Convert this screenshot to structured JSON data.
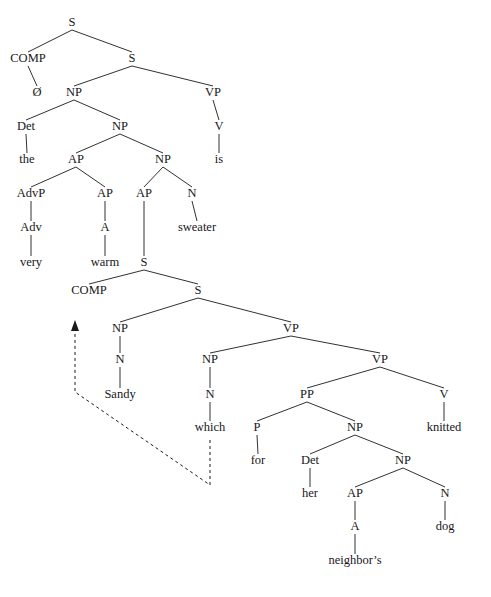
{
  "figure": {
    "background_color": "#ffffff",
    "line_color": "#1a1a1a",
    "text_color": "#17171a",
    "width": 491,
    "height": 597
  },
  "nodes": [
    {
      "id": "s-top",
      "label": "S",
      "x": 72,
      "y": 26,
      "kind": "category"
    },
    {
      "id": "comp-top",
      "label": "COMP",
      "x": 28,
      "y": 62,
      "kind": "category"
    },
    {
      "id": "s-matrix",
      "label": "S",
      "x": 132,
      "y": 62,
      "kind": "category"
    },
    {
      "id": "comp-top-null",
      "label": "Ø",
      "x": 37,
      "y": 96,
      "kind": "leaf"
    },
    {
      "id": "np-subj",
      "label": "NP",
      "x": 74,
      "y": 96,
      "kind": "category"
    },
    {
      "id": "vp-matrix",
      "label": "VP",
      "x": 213,
      "y": 96,
      "kind": "category"
    },
    {
      "id": "det-the",
      "label": "Det",
      "x": 26,
      "y": 130,
      "kind": "category"
    },
    {
      "id": "np-inner",
      "label": "NP",
      "x": 120,
      "y": 130,
      "kind": "category"
    },
    {
      "id": "v-is",
      "label": "V",
      "x": 219,
      "y": 130,
      "kind": "category"
    },
    {
      "id": "the",
      "label": "the",
      "x": 27,
      "y": 163,
      "kind": "leaf"
    },
    {
      "id": "ap-1",
      "label": "AP",
      "x": 76,
      "y": 163,
      "kind": "category"
    },
    {
      "id": "np-2",
      "label": "NP",
      "x": 163,
      "y": 163,
      "kind": "category"
    },
    {
      "id": "is",
      "label": "is",
      "x": 219,
      "y": 163,
      "kind": "leaf"
    },
    {
      "id": "advp",
      "label": "AdvP",
      "x": 31,
      "y": 197,
      "kind": "category"
    },
    {
      "id": "ap-2",
      "label": "AP",
      "x": 105,
      "y": 197,
      "kind": "category"
    },
    {
      "id": "ap-3",
      "label": "AP",
      "x": 144,
      "y": 197,
      "kind": "category"
    },
    {
      "id": "n-sweater",
      "label": "N",
      "x": 192,
      "y": 197,
      "kind": "category"
    },
    {
      "id": "adv",
      "label": "Adv",
      "x": 31,
      "y": 231,
      "kind": "category"
    },
    {
      "id": "a-warm",
      "label": "A",
      "x": 105,
      "y": 231,
      "kind": "category"
    },
    {
      "id": "sweater",
      "label": "sweater",
      "x": 197,
      "y": 231,
      "kind": "leaf"
    },
    {
      "id": "very",
      "label": "very",
      "x": 31,
      "y": 266,
      "kind": "leaf"
    },
    {
      "id": "warm",
      "label": "warm",
      "x": 105,
      "y": 266,
      "kind": "leaf"
    },
    {
      "id": "s-rel",
      "label": "S",
      "x": 144,
      "y": 266,
      "kind": "category"
    },
    {
      "id": "comp-rel",
      "label": "COMP",
      "x": 89,
      "y": 294,
      "kind": "category"
    },
    {
      "id": "s-rel-inner",
      "label": "S",
      "x": 198,
      "y": 294,
      "kind": "category"
    },
    {
      "id": "np-sandy",
      "label": "NP",
      "x": 120,
      "y": 332,
      "kind": "category"
    },
    {
      "id": "vp-rel",
      "label": "VP",
      "x": 291,
      "y": 332,
      "kind": "category"
    },
    {
      "id": "n-sandy",
      "label": "N",
      "x": 120,
      "y": 363,
      "kind": "category"
    },
    {
      "id": "np-which",
      "label": "NP",
      "x": 210,
      "y": 363,
      "kind": "category"
    },
    {
      "id": "vp-rel-inner",
      "label": "VP",
      "x": 380,
      "y": 363,
      "kind": "category"
    },
    {
      "id": "sandy",
      "label": "Sandy",
      "x": 120,
      "y": 398,
      "kind": "leaf"
    },
    {
      "id": "n-which",
      "label": "N",
      "x": 210,
      "y": 398,
      "kind": "category"
    },
    {
      "id": "pp",
      "label": "PP",
      "x": 307,
      "y": 398,
      "kind": "category"
    },
    {
      "id": "v-knitted",
      "label": "V",
      "x": 444,
      "y": 398,
      "kind": "category"
    },
    {
      "id": "which",
      "label": "which",
      "x": 210,
      "y": 431,
      "kind": "leaf"
    },
    {
      "id": "p-for",
      "label": "P",
      "x": 257,
      "y": 431,
      "kind": "category"
    },
    {
      "id": "np-3",
      "label": "NP",
      "x": 355,
      "y": 431,
      "kind": "category"
    },
    {
      "id": "knitted",
      "label": "knitted",
      "x": 444,
      "y": 431,
      "kind": "leaf"
    },
    {
      "id": "for",
      "label": "for",
      "x": 258,
      "y": 464,
      "kind": "leaf"
    },
    {
      "id": "det-her",
      "label": "Det",
      "x": 310,
      "y": 464,
      "kind": "category"
    },
    {
      "id": "np-4",
      "label": "NP",
      "x": 403,
      "y": 464,
      "kind": "category"
    },
    {
      "id": "her",
      "label": "her",
      "x": 310,
      "y": 497,
      "kind": "leaf"
    },
    {
      "id": "ap-4",
      "label": "AP",
      "x": 355,
      "y": 497,
      "kind": "category"
    },
    {
      "id": "n-dog",
      "label": "N",
      "x": 445,
      "y": 497,
      "kind": "category"
    },
    {
      "id": "a-neighbors",
      "label": "A",
      "x": 355,
      "y": 530,
      "kind": "category"
    },
    {
      "id": "dog",
      "label": "dog",
      "x": 445,
      "y": 530,
      "kind": "leaf"
    },
    {
      "id": "neighbors",
      "label": "neighbor’s",
      "x": 355,
      "y": 564,
      "kind": "leaf"
    }
  ],
  "edges": [
    {
      "from": "s-top",
      "to": "comp-top"
    },
    {
      "from": "s-top",
      "to": "s-matrix"
    },
    {
      "from": "comp-top",
      "to": "comp-top-null"
    },
    {
      "from": "s-matrix",
      "to": "np-subj"
    },
    {
      "from": "s-matrix",
      "to": "vp-matrix"
    },
    {
      "from": "np-subj",
      "to": "det-the"
    },
    {
      "from": "np-subj",
      "to": "np-inner"
    },
    {
      "from": "vp-matrix",
      "to": "v-is"
    },
    {
      "from": "det-the",
      "to": "the"
    },
    {
      "from": "np-inner",
      "to": "ap-1"
    },
    {
      "from": "np-inner",
      "to": "np-2"
    },
    {
      "from": "v-is",
      "to": "is"
    },
    {
      "from": "ap-1",
      "to": "advp"
    },
    {
      "from": "ap-1",
      "to": "ap-2"
    },
    {
      "from": "np-2",
      "to": "ap-3"
    },
    {
      "from": "np-2",
      "to": "n-sweater"
    },
    {
      "from": "advp",
      "to": "adv"
    },
    {
      "from": "ap-2",
      "to": "a-warm"
    },
    {
      "from": "ap-3",
      "to": "s-rel"
    },
    {
      "from": "n-sweater",
      "to": "sweater"
    },
    {
      "from": "adv",
      "to": "very"
    },
    {
      "from": "a-warm",
      "to": "warm"
    },
    {
      "from": "s-rel",
      "to": "comp-rel"
    },
    {
      "from": "s-rel",
      "to": "s-rel-inner"
    },
    {
      "from": "s-rel-inner",
      "to": "np-sandy"
    },
    {
      "from": "s-rel-inner",
      "to": "vp-rel"
    },
    {
      "from": "np-sandy",
      "to": "n-sandy"
    },
    {
      "from": "vp-rel",
      "to": "np-which"
    },
    {
      "from": "vp-rel",
      "to": "vp-rel-inner"
    },
    {
      "from": "n-sandy",
      "to": "sandy"
    },
    {
      "from": "np-which",
      "to": "n-which"
    },
    {
      "from": "vp-rel-inner",
      "to": "pp"
    },
    {
      "from": "vp-rel-inner",
      "to": "v-knitted"
    },
    {
      "from": "n-which",
      "to": "which"
    },
    {
      "from": "pp",
      "to": "p-for"
    },
    {
      "from": "pp",
      "to": "np-3"
    },
    {
      "from": "v-knitted",
      "to": "knitted"
    },
    {
      "from": "p-for",
      "to": "for"
    },
    {
      "from": "np-3",
      "to": "det-her"
    },
    {
      "from": "np-3",
      "to": "np-4"
    },
    {
      "from": "det-her",
      "to": "her"
    },
    {
      "from": "np-4",
      "to": "ap-4"
    },
    {
      "from": "np-4",
      "to": "n-dog"
    },
    {
      "from": "ap-4",
      "to": "a-neighbors"
    },
    {
      "from": "n-dog",
      "to": "dog"
    },
    {
      "from": "a-neighbors",
      "to": "neighbors"
    }
  ],
  "movement": {
    "label": "wh-movement-trace",
    "style": "dashed-with-arrowhead",
    "path": "M 210 440 L 210 485 L 75 392 L 75 330",
    "arrow_tip": {
      "x": 75,
      "y": 320
    },
    "arrow_base_left": {
      "x": 71,
      "y": 331
    },
    "arrow_base_right": {
      "x": 79,
      "y": 331
    }
  },
  "header": {
    "faint_text": ""
  }
}
